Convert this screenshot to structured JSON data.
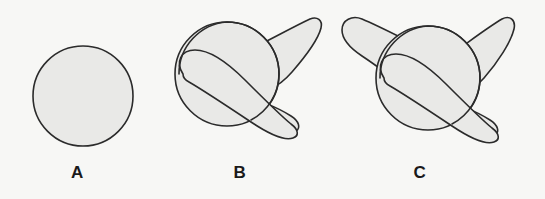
{
  "figure": {
    "background_color": "#f7f7f5",
    "shape_fill_color": "#e9e9e7",
    "shape_outline_color": "#2b2b2b",
    "label_color": "#1a1a1a",
    "panel_count": 3
  },
  "panels": [
    {
      "id": "A",
      "label": "A",
      "description": "plain sphere",
      "features": [
        "sphere"
      ],
      "protrusion_count": 0
    },
    {
      "id": "B",
      "label": "B",
      "description": "sphere with one looping tubular protrusion",
      "features": [
        "sphere",
        "looping-tube",
        "upper-right-horn",
        "lower-tail"
      ],
      "protrusion_count": 1
    },
    {
      "id": "C",
      "label": "C",
      "description": "sphere with two tubular protrusions plus loop",
      "features": [
        "sphere",
        "looping-tube",
        "upper-right-horn",
        "upper-left-horn",
        "lower-tail"
      ],
      "protrusion_count": 2
    }
  ]
}
